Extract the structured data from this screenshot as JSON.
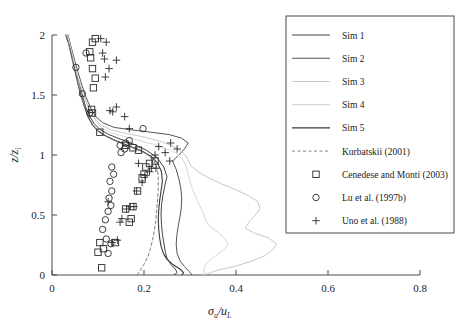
{
  "chart_data": {
    "type": "line",
    "title": "",
    "xlabel": "sigma_u / u_L",
    "ylabel": "z / zi",
    "xlim": [
      0,
      0.8
    ],
    "ylim": [
      0,
      2
    ],
    "xticks": [
      "0",
      "0.2",
      "0.4",
      "0.6",
      "0.8"
    ],
    "xtick_values": [
      0,
      0.2,
      0.4,
      0.6,
      0.8
    ],
    "yticks": [
      "0",
      "0.5",
      "1",
      "1.5",
      "2"
    ],
    "ytick_values": [
      0,
      0.5,
      1,
      1.5,
      2
    ],
    "grid": false,
    "legend_position": "right",
    "axis_label_x_main": "σ",
    "axis_label_x_sub1": "u",
    "axis_label_x_slash": "/u",
    "axis_label_x_sub2": "L",
    "axis_label_y_main": "z/z",
    "axis_label_y_sub": "i",
    "series": [
      {
        "name": "Sim 1",
        "color": "#444444",
        "style": "solid",
        "width": 1.0,
        "points": [
          [
            0.265,
            0.0
          ],
          [
            0.272,
            0.02
          ],
          [
            0.268,
            0.05
          ],
          [
            0.258,
            0.09
          ],
          [
            0.25,
            0.14
          ],
          [
            0.246,
            0.2
          ],
          [
            0.243,
            0.27
          ],
          [
            0.24,
            0.34
          ],
          [
            0.238,
            0.42
          ],
          [
            0.237,
            0.5
          ],
          [
            0.238,
            0.58
          ],
          [
            0.241,
            0.66
          ],
          [
            0.245,
            0.74
          ],
          [
            0.25,
            0.82
          ],
          [
            0.243,
            0.9
          ],
          [
            0.228,
            0.98
          ],
          [
            0.205,
            1.04
          ],
          [
            0.178,
            1.09
          ],
          [
            0.15,
            1.13
          ],
          [
            0.124,
            1.17
          ],
          [
            0.105,
            1.21
          ],
          [
            0.092,
            1.26
          ],
          [
            0.082,
            1.32
          ],
          [
            0.073,
            1.4
          ],
          [
            0.066,
            1.5
          ],
          [
            0.058,
            1.62
          ],
          [
            0.05,
            1.75
          ],
          [
            0.042,
            1.88
          ],
          [
            0.035,
            2.0
          ]
        ]
      },
      {
        "name": "Sim 2",
        "color": "#555555",
        "style": "solid",
        "width": 1.0,
        "points": [
          [
            0.305,
            0.0
          ],
          [
            0.298,
            0.03
          ],
          [
            0.288,
            0.07
          ],
          [
            0.278,
            0.12
          ],
          [
            0.272,
            0.18
          ],
          [
            0.27,
            0.25
          ],
          [
            0.271,
            0.32
          ],
          [
            0.274,
            0.4
          ],
          [
            0.278,
            0.48
          ],
          [
            0.281,
            0.56
          ],
          [
            0.282,
            0.64
          ],
          [
            0.28,
            0.72
          ],
          [
            0.276,
            0.8
          ],
          [
            0.27,
            0.88
          ],
          [
            0.262,
            0.95
          ],
          [
            0.276,
            1.0
          ],
          [
            0.288,
            1.05
          ],
          [
            0.296,
            1.1
          ],
          [
            0.282,
            1.14
          ],
          [
            0.255,
            1.17
          ],
          [
            0.215,
            1.19
          ],
          [
            0.172,
            1.21
          ],
          [
            0.135,
            1.23
          ],
          [
            0.11,
            1.27
          ],
          [
            0.095,
            1.32
          ],
          [
            0.083,
            1.4
          ],
          [
            0.072,
            1.5
          ],
          [
            0.062,
            1.62
          ],
          [
            0.052,
            1.75
          ],
          [
            0.043,
            1.88
          ],
          [
            0.034,
            2.0
          ]
        ]
      },
      {
        "name": "Sim 3",
        "color": "#c8c8c8",
        "style": "solid",
        "width": 1.0,
        "points": [
          [
            0.33,
            0.0
          ],
          [
            0.345,
            0.02
          ],
          [
            0.36,
            0.04
          ],
          [
            0.395,
            0.07
          ],
          [
            0.43,
            0.11
          ],
          [
            0.462,
            0.16
          ],
          [
            0.48,
            0.21
          ],
          [
            0.488,
            0.26
          ],
          [
            0.47,
            0.31
          ],
          [
            0.44,
            0.35
          ],
          [
            0.42,
            0.39
          ],
          [
            0.428,
            0.44
          ],
          [
            0.44,
            0.49
          ],
          [
            0.452,
            0.55
          ],
          [
            0.448,
            0.61
          ],
          [
            0.428,
            0.66
          ],
          [
            0.4,
            0.71
          ],
          [
            0.368,
            0.76
          ],
          [
            0.34,
            0.81
          ],
          [
            0.318,
            0.86
          ],
          [
            0.302,
            0.91
          ],
          [
            0.296,
            0.96
          ],
          [
            0.288,
            1.01
          ],
          [
            0.27,
            1.06
          ],
          [
            0.24,
            1.11
          ],
          [
            0.2,
            1.15
          ],
          [
            0.16,
            1.18
          ],
          [
            0.128,
            1.21
          ],
          [
            0.106,
            1.25
          ],
          [
            0.092,
            1.31
          ],
          [
            0.08,
            1.39
          ],
          [
            0.07,
            1.49
          ],
          [
            0.06,
            1.61
          ],
          [
            0.05,
            1.74
          ],
          [
            0.041,
            1.87
          ],
          [
            0.033,
            2.0
          ]
        ]
      },
      {
        "name": "Sim 4",
        "color": "#d8d8d8",
        "style": "solid",
        "width": 1.0,
        "points": [
          [
            0.332,
            0.01
          ],
          [
            0.33,
            0.05
          ],
          [
            0.336,
            0.1
          ],
          [
            0.352,
            0.15
          ],
          [
            0.37,
            0.2
          ],
          [
            0.382,
            0.25
          ],
          [
            0.378,
            0.3
          ],
          [
            0.362,
            0.35
          ],
          [
            0.345,
            0.4
          ],
          [
            0.335,
            0.45
          ],
          [
            0.33,
            0.5
          ],
          [
            0.325,
            0.55
          ],
          [
            0.318,
            0.6
          ],
          [
            0.312,
            0.66
          ],
          [
            0.305,
            0.72
          ],
          [
            0.3,
            0.78
          ],
          [
            0.296,
            0.84
          ],
          [
            0.292,
            0.9
          ],
          [
            0.285,
            0.96
          ],
          [
            0.268,
            1.02
          ],
          [
            0.238,
            1.07
          ],
          [
            0.2,
            1.11
          ],
          [
            0.162,
            1.15
          ],
          [
            0.132,
            1.18
          ],
          [
            0.11,
            1.22
          ],
          [
            0.095,
            1.28
          ],
          [
            0.083,
            1.36
          ],
          [
            0.072,
            1.46
          ],
          [
            0.062,
            1.58
          ],
          [
            0.052,
            1.72
          ],
          [
            0.043,
            1.86
          ],
          [
            0.034,
            2.0
          ]
        ]
      },
      {
        "name": "Sim 5",
        "color": "#3a3a3a",
        "style": "solid",
        "width": 1.1,
        "points": [
          [
            0.282,
            0.0
          ],
          [
            0.286,
            0.02
          ],
          [
            0.278,
            0.05
          ],
          [
            0.262,
            0.09
          ],
          [
            0.25,
            0.13
          ],
          [
            0.242,
            0.18
          ],
          [
            0.237,
            0.24
          ],
          [
            0.234,
            0.31
          ],
          [
            0.232,
            0.38
          ],
          [
            0.231,
            0.46
          ],
          [
            0.232,
            0.54
          ],
          [
            0.234,
            0.62
          ],
          [
            0.237,
            0.7
          ],
          [
            0.24,
            0.78
          ],
          [
            0.238,
            0.86
          ],
          [
            0.23,
            0.93
          ],
          [
            0.215,
            0.99
          ],
          [
            0.192,
            1.04
          ],
          [
            0.165,
            1.08
          ],
          [
            0.138,
            1.12
          ],
          [
            0.116,
            1.16
          ],
          [
            0.1,
            1.2
          ],
          [
            0.088,
            1.25
          ],
          [
            0.078,
            1.32
          ],
          [
            0.07,
            1.41
          ],
          [
            0.061,
            1.52
          ],
          [
            0.053,
            1.65
          ],
          [
            0.044,
            1.8
          ],
          [
            0.036,
            1.93
          ],
          [
            0.03,
            2.0
          ]
        ]
      },
      {
        "name": "Kurbatskii (2001)",
        "color": "#808080",
        "style": "dashed",
        "width": 1.0,
        "points": [
          [
            0.185,
            0.0
          ],
          [
            0.192,
            0.04
          ],
          [
            0.2,
            0.09
          ],
          [
            0.208,
            0.15
          ],
          [
            0.214,
            0.22
          ],
          [
            0.219,
            0.3
          ],
          [
            0.223,
            0.38
          ],
          [
            0.226,
            0.47
          ],
          [
            0.228,
            0.56
          ],
          [
            0.23,
            0.65
          ],
          [
            0.231,
            0.74
          ],
          [
            0.231,
            0.83
          ],
          [
            0.228,
            0.9
          ],
          [
            0.22,
            0.96
          ],
          [
            0.205,
            1.01
          ],
          [
            0.182,
            1.05
          ],
          [
            0.155,
            1.09
          ],
          [
            0.13,
            1.13
          ],
          [
            0.11,
            1.17
          ],
          [
            0.095,
            1.22
          ],
          [
            0.083,
            1.29
          ],
          [
            0.073,
            1.38
          ],
          [
            0.064,
            1.49
          ],
          [
            0.055,
            1.62
          ],
          [
            0.046,
            1.76
          ],
          [
            0.038,
            1.9
          ],
          [
            0.031,
            2.0
          ]
        ]
      }
    ],
    "scatter": [
      {
        "name": "Cenedese and Monti (2003)",
        "marker": "square",
        "color": "#2a2a2a",
        "points": [
          [
            0.108,
            0.06
          ],
          [
            0.1,
            0.19
          ],
          [
            0.112,
            0.22
          ],
          [
            0.104,
            0.27
          ],
          [
            0.138,
            0.27
          ],
          [
            0.168,
            0.44
          ],
          [
            0.172,
            0.47
          ],
          [
            0.16,
            0.55
          ],
          [
            0.176,
            0.57
          ],
          [
            0.186,
            0.7
          ],
          [
            0.196,
            0.81
          ],
          [
            0.2,
            0.84
          ],
          [
            0.204,
            0.9
          ],
          [
            0.212,
            0.93
          ],
          [
            0.224,
            0.95
          ],
          [
            0.188,
            1.04
          ],
          [
            0.176,
            1.06
          ],
          [
            0.16,
            1.08
          ],
          [
            0.104,
            1.19
          ],
          [
            0.088,
            1.35
          ],
          [
            0.086,
            1.38
          ],
          [
            0.09,
            1.56
          ],
          [
            0.094,
            1.64
          ],
          [
            0.088,
            1.72
          ],
          [
            0.084,
            1.81
          ],
          [
            0.082,
            1.86
          ],
          [
            0.088,
            1.94
          ],
          [
            0.094,
            1.97
          ]
        ]
      },
      {
        "name": "Lu et al. (1997b)",
        "marker": "circle",
        "color": "#2a2a2a",
        "points": [
          [
            0.122,
            0.18
          ],
          [
            0.128,
            0.26
          ],
          [
            0.118,
            0.3
          ],
          [
            0.11,
            0.38
          ],
          [
            0.116,
            0.46
          ],
          [
            0.122,
            0.53
          ],
          [
            0.128,
            0.58
          ],
          [
            0.124,
            0.64
          ],
          [
            0.13,
            0.7
          ],
          [
            0.126,
            0.78
          ],
          [
            0.134,
            0.84
          ],
          [
            0.13,
            0.9
          ],
          [
            0.15,
            1.02
          ],
          [
            0.158,
            1.05
          ],
          [
            0.148,
            1.08
          ],
          [
            0.16,
            1.1
          ],
          [
            0.168,
            1.12
          ],
          [
            0.198,
            1.22
          ],
          [
            0.082,
            1.35
          ],
          [
            0.066,
            1.51
          ],
          [
            0.052,
            1.73
          ],
          [
            0.074,
            1.85
          ]
        ]
      },
      {
        "name": "Uno et al. (1988)",
        "marker": "plus",
        "color": "#2a2a2a",
        "points": [
          [
            0.13,
            0.27
          ],
          [
            0.142,
            0.29
          ],
          [
            0.148,
            0.44
          ],
          [
            0.152,
            0.47
          ],
          [
            0.162,
            0.55
          ],
          [
            0.17,
            0.57
          ],
          [
            0.178,
            0.57
          ],
          [
            0.122,
            0.61
          ],
          [
            0.184,
            0.7
          ],
          [
            0.196,
            0.77
          ],
          [
            0.202,
            0.83
          ],
          [
            0.212,
            0.86
          ],
          [
            0.216,
            0.89
          ],
          [
            0.226,
            0.89
          ],
          [
            0.188,
            0.93
          ],
          [
            0.256,
            0.95
          ],
          [
            0.224,
            1.0
          ],
          [
            0.246,
            1.02
          ],
          [
            0.272,
            1.05
          ],
          [
            0.232,
            1.07
          ],
          [
            0.258,
            1.1
          ],
          [
            0.168,
            1.22
          ],
          [
            0.158,
            1.32
          ],
          [
            0.132,
            1.36
          ],
          [
            0.126,
            1.37
          ],
          [
            0.14,
            1.4
          ],
          [
            0.116,
            1.65
          ],
          [
            0.124,
            1.72
          ],
          [
            0.14,
            1.79
          ],
          [
            0.114,
            1.8
          ],
          [
            0.11,
            1.85
          ],
          [
            0.118,
            1.94
          ],
          [
            0.106,
            1.97
          ]
        ]
      }
    ]
  },
  "legend": {
    "items": [
      {
        "label": "Sim 1",
        "kind": "line"
      },
      {
        "label": "Sim 2",
        "kind": "line"
      },
      {
        "label": "Sim 3",
        "kind": "line"
      },
      {
        "label": "Sim 4",
        "kind": "line"
      },
      {
        "label": "Sim 5",
        "kind": "line"
      },
      {
        "label": "Kurbatskii (2001)",
        "kind": "dashed"
      },
      {
        "label": "Cenedese and Monti (2003)",
        "kind": "square"
      },
      {
        "label": "Lu et al. (1997b)",
        "kind": "circle"
      },
      {
        "label": "Uno et al. (1988)",
        "kind": "plus"
      }
    ]
  },
  "colors": {
    "axis": "#4a4a4a",
    "text": "#1a1a1a",
    "background": "#ffffff"
  }
}
